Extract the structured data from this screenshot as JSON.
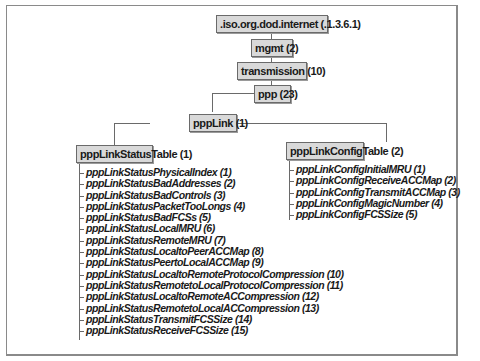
{
  "diagram": {
    "type": "tree",
    "nodes": {
      "root": ".iso.org.dod.internet (.1.3.6.1)",
      "mgmt": "mgmt (2)",
      "transmission": "transmission (10)",
      "ppp": "ppp (23)",
      "pppLink": "pppLink (1)",
      "statusTable": "pppLinkStatusTable (1)",
      "configTable": "pppLinkConfigTable (2)"
    },
    "status_items": [
      "pppLinkStatusPhysicalIndex (1)",
      "pppLinkStatusBadAddresses (2)",
      "pppLinkStatusBadControls (3)",
      "pppLinkStatusPacketTooLongs (4)",
      "pppLinkStatusBadFCSs (5)",
      "pppLinkStatusLocalMRU (6)",
      "pppLinkStatusRemoteMRU (7)",
      "pppLinkStatusLocaltoPeerACCMap (8)",
      "pppLinkStatusPeertoLocalACCMap (9)",
      "pppLinkStatusLocaltoRemoteProtocolCompression (10)",
      "pppLinkStatusRemotetoLocalProtocolCompression (11)",
      "pppLinkStatusLocaltoRemoteACCompression (12)",
      "pppLinkStatusRemotetoLocalACCompression (13)",
      "pppLinkStatusTransmitFCSSize (14)",
      "pppLinkStatusReceiveFCSSize (15)"
    ],
    "config_items": [
      "pppLinkConfigInitialMRU (1)",
      "pppLinkConfigReceiveACCMap (2)",
      "pppLinkConfigTransmitACCMap (3)",
      "pppLinkConfigMagicNumber (4)",
      "pppLinkConfigFCSSize (5)"
    ]
  }
}
